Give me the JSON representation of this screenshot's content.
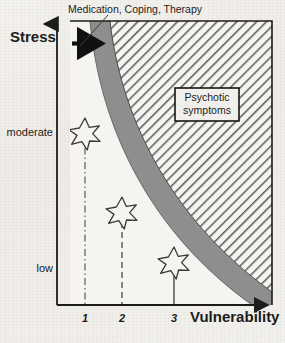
{
  "figure": {
    "type": "diagram",
    "background_color": "#f2f0ec"
  },
  "axes": {
    "y": {
      "title": "Stress",
      "tick_labels": [
        "moderate",
        "low"
      ],
      "arrow": "up"
    },
    "x": {
      "title": "Vulnerability",
      "tick_labels": [
        "1",
        "2",
        "3"
      ],
      "arrow": "right"
    }
  },
  "annotations": {
    "top_label": "Medication, Coping, Therapy",
    "region_box": {
      "line1": "Psychotic",
      "line2": "symptoms"
    }
  },
  "regions": {
    "transition_band_color": "#8a8a8a",
    "psychotic_zone_hatch_color": "#555555",
    "plot_border_color": "#1c1c1c"
  },
  "markers": {
    "star_count": 3,
    "star_fill": "#f4f2ee",
    "star_stroke": "#3a3a3a"
  },
  "vertical_lines": [
    {
      "label": "1",
      "style": "dash-dot"
    },
    {
      "label": "2",
      "style": "dashed"
    },
    {
      "label": "3",
      "style": "solid"
    }
  ],
  "arrow_annotation": {
    "direction": "right",
    "meaning": "treatment shifts threshold"
  }
}
